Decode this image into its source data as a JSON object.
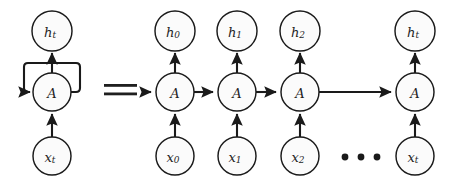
{
  "figure": {
    "type": "diagram",
    "background_color": "#ffffff",
    "stroke_color": "#1a1a1a",
    "node_fill_color": "#fbfbfb",
    "text_color": "#1f1f1f"
  },
  "equality": {
    "symbol": "=",
    "label": "equals"
  },
  "left_diagram": {
    "name": "folded-rnn",
    "nodes": [
      {
        "id": "h-t",
        "base": "h",
        "sub": "t",
        "role": "output",
        "cx": 52,
        "cy": 31,
        "r": 20
      },
      {
        "id": "a-cell",
        "base": "A",
        "sub": "",
        "role": "cell",
        "cx": 52,
        "cy": 92,
        "r": 19
      },
      {
        "id": "x-t",
        "base": "x",
        "sub": "t",
        "role": "input",
        "cx": 52,
        "cy": 156,
        "r": 19
      }
    ],
    "edges": [
      {
        "from": "x-t",
        "to": "a-cell",
        "kind": "vertical-up"
      },
      {
        "from": "a-cell",
        "to": "h-t",
        "kind": "vertical-up"
      },
      {
        "from": "a-cell",
        "to": "a-cell",
        "kind": "self-loop"
      }
    ]
  },
  "right_diagram": {
    "name": "unrolled-rnn",
    "columns": [
      {
        "output": {
          "base": "h",
          "sub": "0"
        },
        "cell": {
          "base": "A",
          "sub": ""
        },
        "input": {
          "base": "x",
          "sub": "0"
        },
        "cx": 175
      },
      {
        "output": {
          "base": "h",
          "sub": "1"
        },
        "cell": {
          "base": "A",
          "sub": ""
        },
        "input": {
          "base": "x",
          "sub": "1"
        },
        "cx": 237
      },
      {
        "output": {
          "base": "h",
          "sub": "2"
        },
        "cell": {
          "base": "A",
          "sub": ""
        },
        "input": {
          "base": "x",
          "sub": "2"
        },
        "cx": 300
      },
      {
        "output": {
          "base": "h",
          "sub": "t"
        },
        "cell": {
          "base": "A",
          "sub": ""
        },
        "input": {
          "base": "x",
          "sub": "t"
        },
        "cx": 415
      }
    ],
    "rows": {
      "output_cy": 31,
      "cell_cy": 92,
      "input_cy": 156
    },
    "radii": {
      "output_r": 20,
      "cell_r": 19,
      "input_r": 19
    },
    "ellipsis": {
      "label": "continues",
      "dots": 3,
      "cx": [
        345,
        361,
        377
      ],
      "cy": 157,
      "r": 3.4
    },
    "horizontal_edges": [
      {
        "from": 0,
        "to": 1
      },
      {
        "from": 1,
        "to": 2
      },
      {
        "from": 2,
        "to": 3
      }
    ],
    "incoming_edge_from_left": true
  }
}
